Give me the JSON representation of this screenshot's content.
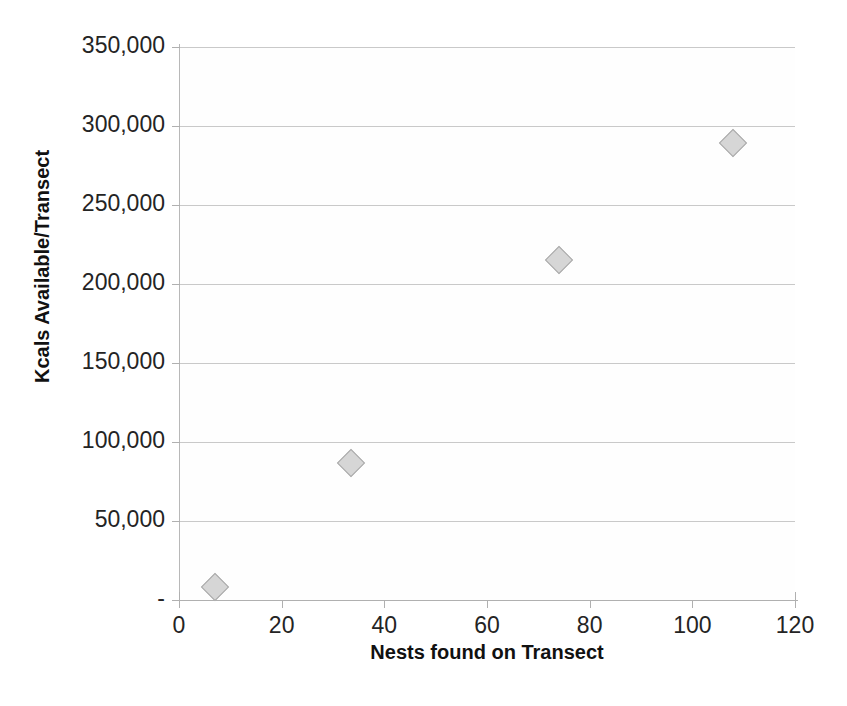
{
  "chart_data": {
    "type": "scatter",
    "title": "",
    "xlabel": "Nests found on Transect",
    "ylabel": "Kcals Available/Transect",
    "xlim": [
      0,
      120
    ],
    "ylim": [
      0,
      350000
    ],
    "grid": true,
    "legend": false,
    "x_ticks": [
      "0",
      "20",
      "40",
      "60",
      "80",
      "100",
      "120"
    ],
    "x_tick_values": [
      0,
      20,
      40,
      60,
      80,
      100,
      120
    ],
    "y_ticks": [
      "-",
      "50,000",
      "100,000",
      "150,000",
      "200,000",
      "250,000",
      "300,000",
      "350,000"
    ],
    "y_tick_values": [
      0,
      50000,
      100000,
      150000,
      200000,
      250000,
      300000,
      350000
    ],
    "series": [
      {
        "name": "Kcals Available/Transect",
        "marker": "diamond",
        "marker_fill": "#d6d6d6",
        "marker_edge": "#a8a8a8",
        "points": [
          {
            "x": 7,
            "y": 8300
          },
          {
            "x": 33.5,
            "y": 87000
          },
          {
            "x": 74,
            "y": 215000
          },
          {
            "x": 108,
            "y": 289000
          }
        ]
      }
    ]
  },
  "colors": {
    "background": "#ffffff",
    "gridline": "#c9c9c9",
    "axis": "#b0b0b0",
    "text": "#242424",
    "title_text": "#111111"
  }
}
